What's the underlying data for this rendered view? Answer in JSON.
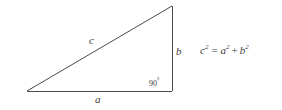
{
  "figure": {
    "type": "right-triangle-diagram",
    "background_color": "#ffffff",
    "stroke_color": "#4a4a4a",
    "text_color": "#3a3a3a"
  },
  "triangle": {
    "vertices": {
      "bottom_left": {
        "x": 27,
        "y": 91
      },
      "bottom_right": {
        "x": 172,
        "y": 91
      },
      "top_right": {
        "x": 172,
        "y": 6
      }
    },
    "sides": {
      "hypotenuse_label": "c",
      "vertical_leg_label": "b",
      "base_label": "a"
    },
    "right_angle": {
      "value": "90",
      "degree_symbol": "°"
    }
  },
  "equation": {
    "full_text": "c² = a² + b²",
    "left_base": "c",
    "left_exponent": "2",
    "equals": "=",
    "first_term_base": "a",
    "first_term_exponent": "2",
    "plus": "+",
    "second_term_base": "b",
    "second_term_exponent": "2"
  }
}
